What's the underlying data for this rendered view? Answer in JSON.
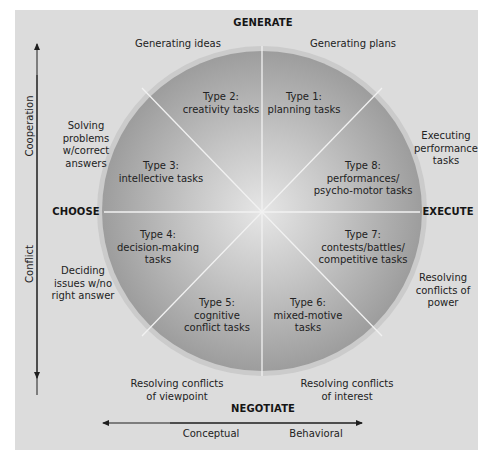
{
  "poles": {
    "top": "GENERATE",
    "bottom": "NEGOTIATE",
    "left": "CHOOSE",
    "right": "EXECUTE"
  },
  "axes": {
    "vertical_top": "Cooperation",
    "vertical_bottom": "Conflict",
    "horizontal_left": "Conceptual",
    "horizontal_right": "Behavioral"
  },
  "segments": [
    {
      "id": 1,
      "label": "Type 1:\nplanning tasks"
    },
    {
      "id": 2,
      "label": "Type 2:\ncreativity tasks"
    },
    {
      "id": 3,
      "label": "Type 3:\nintellective tasks"
    },
    {
      "id": 4,
      "label": "Type 4:\ndecision-making\ntasks"
    },
    {
      "id": 5,
      "label": "Type 5:\ncognitive\nconflict tasks"
    },
    {
      "id": 6,
      "label": "Type 6:\nmixed-motive\ntasks"
    },
    {
      "id": 7,
      "label": "Type 7:\ncontests/battles/\ncompetitive tasks"
    },
    {
      "id": 8,
      "label": "Type 8:\nperformances/\npsycho-motor tasks"
    }
  ],
  "outer": {
    "generating_ideas": "Generating ideas",
    "generating_plans": "Generating plans",
    "solving_problems": "Solving\nproblems\nw/correct\nanswers",
    "executing_performance": "Executing\nperformance\ntasks",
    "deciding_issues": "Deciding\nissues w/no\nright answer",
    "resolving_power": "Resolving\nconflicts of\npower",
    "resolving_viewpoint": "Resolving conflicts\nof viewpoint",
    "resolving_interest": "Resolving conflicts\nof interest"
  },
  "colors": {
    "panel": "#dcdcdc",
    "circle_center": "#e4e4e4",
    "circle_edge": "#9a9a9a",
    "rim": "#c8c8c8",
    "divider": "#f4f4f4",
    "arrow": "#1e1e1e"
  }
}
